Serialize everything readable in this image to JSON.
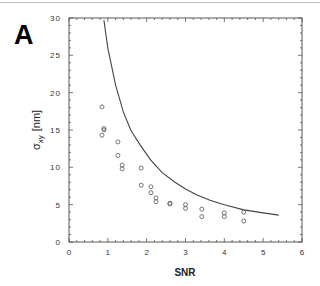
{
  "panel_label": "A",
  "chart_data": {
    "type": "scatter",
    "title": "",
    "xlabel": "SNR",
    "ylabel": "σ_xy [nm]",
    "ylabel_main": "σ",
    "ylabel_sub": "xy",
    "ylabel_unit": "[nm]",
    "xlim": [
      0,
      6
    ],
    "ylim": [
      0,
      30
    ],
    "xticks": [
      0,
      1,
      2,
      3,
      4,
      5,
      6
    ],
    "yticks": [
      0,
      5,
      10,
      15,
      20,
      25,
      30
    ],
    "xtick_labels": [
      "0",
      "1",
      "2",
      "3",
      "4",
      "5",
      "6"
    ],
    "ytick_labels": [
      "0",
      "5",
      "10",
      "15",
      "20",
      "25",
      "30"
    ],
    "x_minor_step": 0.2,
    "y_minor_step": 1,
    "grid": false,
    "legend": null,
    "series": [
      {
        "name": "measured",
        "kind": "scatter",
        "marker": "open-circle",
        "points": [
          [
            0.85,
            18.1
          ],
          [
            0.9,
            15.2
          ],
          [
            0.9,
            15.0
          ],
          [
            0.85,
            14.3
          ],
          [
            1.26,
            13.4
          ],
          [
            1.26,
            11.6
          ],
          [
            1.37,
            10.3
          ],
          [
            1.37,
            9.8
          ],
          [
            1.86,
            9.9
          ],
          [
            1.86,
            7.6
          ],
          [
            2.11,
            7.4
          ],
          [
            2.11,
            6.6
          ],
          [
            2.24,
            5.9
          ],
          [
            2.24,
            5.4
          ],
          [
            2.6,
            5.2
          ],
          [
            2.6,
            5.1
          ],
          [
            3.0,
            5.0
          ],
          [
            3.0,
            4.5
          ],
          [
            3.42,
            4.4
          ],
          [
            3.42,
            3.4
          ],
          [
            4.0,
            3.9
          ],
          [
            4.0,
            3.4
          ],
          [
            4.5,
            4.0
          ],
          [
            4.5,
            2.8
          ]
        ]
      },
      {
        "name": "theory",
        "kind": "line",
        "points": [
          [
            0.9,
            29.7
          ],
          [
            1.0,
            26.0
          ],
          [
            1.2,
            21.0
          ],
          [
            1.4,
            17.4
          ],
          [
            1.6,
            14.9
          ],
          [
            1.83,
            13.0
          ],
          [
            2.1,
            11.0
          ],
          [
            2.4,
            9.3
          ],
          [
            2.73,
            8.0
          ],
          [
            3.0,
            7.1
          ],
          [
            3.3,
            6.3
          ],
          [
            3.63,
            5.6
          ],
          [
            4.0,
            5.0
          ],
          [
            4.5,
            4.3
          ],
          [
            5.0,
            3.9
          ],
          [
            5.4,
            3.6
          ]
        ]
      }
    ]
  }
}
